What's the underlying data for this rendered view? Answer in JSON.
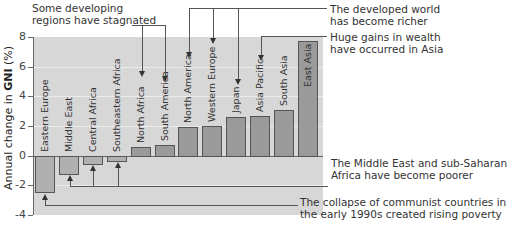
{
  "chart_data": {
    "type": "bar",
    "title": "",
    "xlabel": "",
    "ylabel": "Annual change in GNI (%)",
    "ylim": [
      -4,
      8
    ],
    "yticks": [
      8,
      6,
      4,
      2,
      0,
      -2,
      -4
    ],
    "grid": true,
    "categories": [
      "Eastern Europe",
      "Middle East",
      "Central Africa",
      "Southeastern Africa",
      "North Africa",
      "South America",
      "North America",
      "Western Europe",
      "Japan",
      "Asia Pacific",
      "South Asia",
      "East Asia"
    ],
    "values": [
      -2.5,
      -1.3,
      -0.6,
      -0.4,
      0.6,
      0.7,
      1.9,
      2.0,
      2.6,
      2.7,
      3.1,
      7.7
    ],
    "annotations": [
      {
        "text": "Some developing regions have stagnated",
        "points_to": [
          "North Africa",
          "South America"
        ]
      },
      {
        "text": "The developed world has become richer",
        "points_to": [
          "North America",
          "Western Europe",
          "Japan"
        ]
      },
      {
        "text": "Huge gains in wealth have occurred in Asia",
        "points_to": [
          "Asia Pacific"
        ]
      },
      {
        "text": "The Middle East and sub-Saharan Africa have become poorer",
        "points_to": [
          "Middle East",
          "Central Africa",
          "Southeastern Africa"
        ]
      },
      {
        "text": "The collapse of communist countries in the early 1990s created rising poverty",
        "points_to": [
          "Eastern Europe"
        ]
      }
    ]
  },
  "axis": {
    "ylabel_prefix": "Annual change in ",
    "ylabel_bold": "GNI",
    "ylabel_suffix": " (%)",
    "ticks": [
      "8",
      "6",
      "4",
      "2",
      "0",
      "-2",
      "-4"
    ]
  },
  "annotations": {
    "stagnated_1": "Some developing",
    "stagnated_2": "regions have stagnated",
    "developed_1": "The developed world",
    "developed_2": "has become richer",
    "asia_1": "Huge gains in wealth",
    "asia_2": "have occurred in Asia",
    "poorer_1": "The Middle East and sub-Saharan",
    "poorer_2": "Africa have become poorer",
    "communist_1": "The collapse of communist countries in",
    "communist_2": "the early 1990s created rising poverty"
  },
  "colors": {
    "plot_bg": "#d7d7d7",
    "bar_fill": "#9a9a9a",
    "bar_border": "#555555"
  }
}
